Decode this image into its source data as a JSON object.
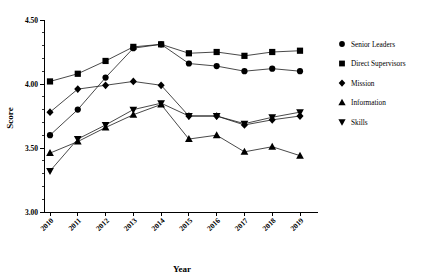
{
  "chart_data": {
    "type": "line",
    "title": "",
    "xlabel": "Year",
    "ylabel": "Score",
    "categories": [
      "2010",
      "2011",
      "2012",
      "2013",
      "2014",
      "2015",
      "2016",
      "2017",
      "2018",
      "2019"
    ],
    "x": [
      2010,
      2011,
      2012,
      2013,
      2014,
      2015,
      2016,
      2017,
      2018,
      2019
    ],
    "ylim": [
      3.0,
      4.5
    ],
    "yticks": [
      "3.00",
      "3.50",
      "4.00",
      "4.50"
    ],
    "ytick_values": [
      3.0,
      3.5,
      4.0,
      4.5
    ],
    "y_minor_tick_step": 0.1,
    "grid": false,
    "legend_position": "right",
    "series": [
      {
        "name": "Senior Leaders",
        "marker": "circle",
        "values": [
          3.6,
          3.8,
          4.05,
          4.28,
          4.31,
          4.16,
          4.14,
          4.1,
          4.12,
          4.1
        ]
      },
      {
        "name": "Direct Supervisors",
        "marker": "square",
        "values": [
          4.02,
          4.08,
          4.18,
          4.29,
          4.31,
          4.24,
          4.25,
          4.22,
          4.25,
          4.26
        ]
      },
      {
        "name": "Mission",
        "marker": "diamond",
        "values": [
          3.78,
          3.96,
          3.99,
          4.02,
          3.99,
          3.75,
          3.75,
          3.68,
          3.72,
          3.75
        ]
      },
      {
        "name": "Information",
        "marker": "triangle-up",
        "values": [
          3.46,
          3.55,
          3.66,
          3.76,
          3.84,
          3.57,
          3.6,
          3.47,
          3.51,
          3.44
        ]
      },
      {
        "name": "Skills",
        "marker": "triangle-down",
        "values": [
          3.32,
          3.57,
          3.68,
          3.8,
          3.85,
          3.75,
          3.75,
          3.69,
          3.74,
          3.78
        ]
      }
    ]
  },
  "legend": {
    "items": [
      {
        "label": "Senior Leaders"
      },
      {
        "label": "Direct Supervisors"
      },
      {
        "label": "Mission"
      },
      {
        "label": "Information"
      },
      {
        "label": "Skills"
      }
    ]
  },
  "axes": {
    "y_title": "Score",
    "x_title": "Year"
  }
}
